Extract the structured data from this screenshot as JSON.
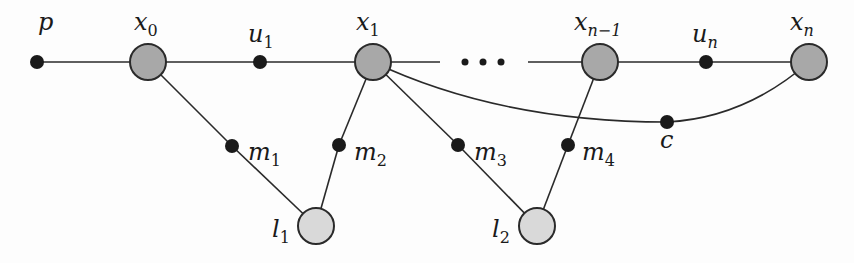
{
  "diagram": {
    "type": "graph",
    "nodes": [
      {
        "id": "p",
        "label": "p",
        "sub": "",
        "kind": "small",
        "x": 37,
        "y": 62,
        "lx": 38,
        "ly": 30
      },
      {
        "id": "x0",
        "label": "x",
        "sub": "0",
        "kind": "large",
        "x": 148,
        "y": 62,
        "lx": 134,
        "ly": 30
      },
      {
        "id": "u1",
        "label": "u",
        "sub": "1",
        "kind": "small",
        "x": 260,
        "y": 62,
        "lx": 248,
        "ly": 42
      },
      {
        "id": "x1",
        "label": "x",
        "sub": "1",
        "kind": "large",
        "x": 373,
        "y": 62,
        "lx": 356,
        "ly": 30
      },
      {
        "id": "xn-1",
        "label": "x",
        "sub": "n−1",
        "kind": "large",
        "x": 600,
        "y": 62,
        "lx": 574,
        "ly": 30
      },
      {
        "id": "un",
        "label": "u",
        "sub": "n",
        "kind": "small",
        "x": 706,
        "y": 62,
        "lx": 692,
        "ly": 42
      },
      {
        "id": "xn",
        "label": "x",
        "sub": "n",
        "kind": "large",
        "x": 809,
        "y": 62,
        "lx": 790,
        "ly": 30
      },
      {
        "id": "m1",
        "label": "m",
        "sub": "1",
        "kind": "small",
        "x": 232,
        "y": 146,
        "lx": 248,
        "ly": 160
      },
      {
        "id": "m2",
        "label": "m",
        "sub": "2",
        "kind": "small",
        "x": 339,
        "y": 145,
        "lx": 354,
        "ly": 160
      },
      {
        "id": "m3",
        "label": "m",
        "sub": "3",
        "kind": "small",
        "x": 458,
        "y": 145,
        "lx": 474,
        "ly": 160
      },
      {
        "id": "m4",
        "label": "m",
        "sub": "4",
        "kind": "small",
        "x": 568,
        "y": 145,
        "lx": 582,
        "ly": 160
      },
      {
        "id": "c",
        "label": "c",
        "sub": "",
        "kind": "small",
        "x": 667,
        "y": 122,
        "lx": 660,
        "ly": 148
      },
      {
        "id": "l1",
        "label": "l",
        "sub": "1",
        "kind": "light",
        "x": 316,
        "y": 226,
        "lx": 272,
        "ly": 237
      },
      {
        "id": "l2",
        "label": "l",
        "sub": "2",
        "kind": "light",
        "x": 537,
        "y": 226,
        "lx": 492,
        "ly": 237
      }
    ],
    "edges": [
      {
        "from": "p",
        "to": "x0"
      },
      {
        "from": "x0",
        "to": "u1"
      },
      {
        "from": "u1",
        "to": "x1"
      },
      {
        "from": "x0",
        "to": "m1"
      },
      {
        "from": "m1",
        "to": "l1"
      },
      {
        "from": "x1",
        "to": "m2"
      },
      {
        "from": "m2",
        "to": "l1"
      },
      {
        "from": "x1",
        "to": "m3"
      },
      {
        "from": "m3",
        "to": "l2"
      },
      {
        "from": "xn-1",
        "to": "m4"
      },
      {
        "from": "m4",
        "to": "l2"
      },
      {
        "from": "xn-1",
        "to": "un"
      },
      {
        "from": "un",
        "to": "xn"
      },
      {
        "from": "x1",
        "to": "c",
        "curved": true
      },
      {
        "from": "c",
        "to": "xn",
        "curved": true
      }
    ],
    "ellipsis": {
      "text": "• • •",
      "x": 483,
      "y": 62
    },
    "colors": {
      "large_fill": "#a8a8a8",
      "light_fill": "#d9d9d9",
      "small_fill": "#1a1a1a",
      "stroke": "#2a2a2a"
    }
  }
}
